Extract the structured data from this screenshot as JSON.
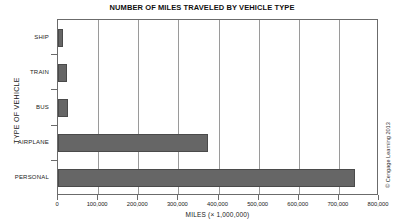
{
  "chart_data": {
    "type": "bar",
    "orientation": "horizontal",
    "title": "NUMBER OF MILES TRAVELED BY VEHICLE TYPE",
    "xlabel": "MILES (× 1,000,000)",
    "ylabel": "TYPE OF VEHICLE",
    "categories": [
      "SHIP",
      "TRAIN",
      "BUS",
      "AIRPLANE",
      "PERSONAL"
    ],
    "values": [
      12000,
      22000,
      25000,
      374000,
      740000
    ],
    "xlim": [
      0,
      800000
    ],
    "xticks": [
      0,
      100000,
      200000,
      300000,
      400000,
      500000,
      600000,
      700000,
      800000
    ],
    "xticklabels": [
      "0",
      "100,000",
      "200,000",
      "300,000",
      "400,000",
      "500,000",
      "600,000",
      "700,000",
      "800,000"
    ],
    "grid": "vertical",
    "legend": "none",
    "bar_color": "#666666",
    "bar_edge_color": "#4a4a4a",
    "grid_color": "#9a9a9a",
    "frame_color": "#6b6b6b"
  },
  "credit": "© Cengage Learning 2013"
}
